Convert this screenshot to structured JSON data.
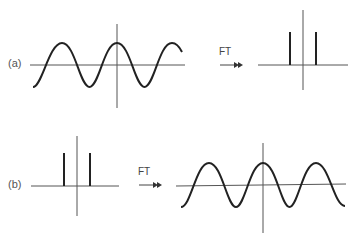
{
  "panels": [
    {
      "label": "(a)",
      "input": {
        "type": "cosine",
        "periods": "~3",
        "description": "cosine wave with peak at origin"
      },
      "operation": "FT",
      "output": {
        "type": "delta-pair",
        "description": "two symmetric spikes at ±frequency"
      }
    },
    {
      "label": "(b)",
      "input": {
        "type": "delta-pair",
        "description": "two symmetric spikes at ±position"
      },
      "operation": "FT",
      "output": {
        "type": "cosine",
        "periods": "~3",
        "description": "cosine wave with peak at origin"
      }
    }
  ],
  "colors": {
    "stroke": "#222222",
    "axis": "#555555",
    "text": "#555555"
  }
}
